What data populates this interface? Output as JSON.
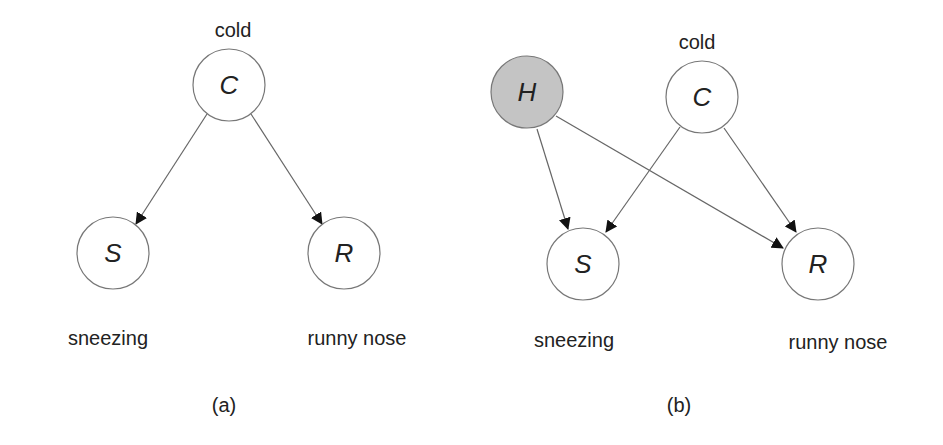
{
  "panels": [
    {
      "id": "a",
      "caption": "(a)",
      "nodes": [
        {
          "id": "C",
          "letter": "C",
          "label": "cold",
          "shaded": false
        },
        {
          "id": "S",
          "letter": "S",
          "label": "sneezing",
          "shaded": false
        },
        {
          "id": "R",
          "letter": "R",
          "label": "runny nose",
          "shaded": false
        }
      ],
      "edges": [
        [
          "C",
          "S"
        ],
        [
          "C",
          "R"
        ]
      ]
    },
    {
      "id": "b",
      "caption": "(b)",
      "nodes": [
        {
          "id": "H",
          "letter": "H",
          "label": "",
          "shaded": true
        },
        {
          "id": "C",
          "letter": "C",
          "label": "cold",
          "shaded": false
        },
        {
          "id": "S",
          "letter": "S",
          "label": "sneezing",
          "shaded": false
        },
        {
          "id": "R",
          "letter": "R",
          "label": "runny nose",
          "shaded": false
        }
      ],
      "edges": [
        [
          "H",
          "S"
        ],
        [
          "H",
          "R"
        ],
        [
          "C",
          "S"
        ],
        [
          "C",
          "R"
        ]
      ]
    }
  ],
  "colors": {
    "shaded_fill": "#c4c4c4",
    "stroke": "#666666",
    "arrow": "#111111"
  }
}
